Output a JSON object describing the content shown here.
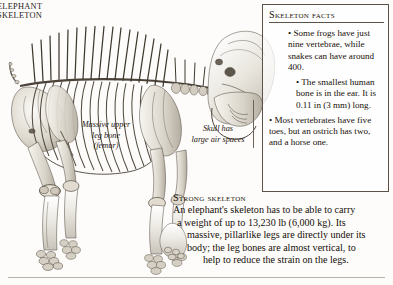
{
  "running_head": {
    "line1": "ELEPHANT",
    "line2": "SKELETON"
  },
  "captions": {
    "femur": "Massive upper leg bone (femur)",
    "femur_lines": [
      "Massive upper",
      "leg bone",
      "(femur)"
    ],
    "skull": "Skull has large air spaces",
    "skull_lines": [
      "Skull has",
      "large air spaces"
    ]
  },
  "facts_box": {
    "title": "Skeleton facts",
    "bullets": [
      "• Some frogs have just nine vertebrae, while snakes can have around 400.",
      "• The smallest human bone is in the ear. It is 0.11 in (3 mm) long.",
      "• Most vertebrates have five toes, but an ostrich has two, and a horse one."
    ]
  },
  "strong_skeleton": {
    "title": "Strong skeleton",
    "body": "An elephant's skeleton has to be able to carry a weight of up to 13,230 lb (6,000 kg). Its massive, pillarlike legs are directly under its body; the leg bones are almost vertical, to help to reduce the strain on the legs.",
    "lines": [
      "An elephant's skeleton has to be able to carry",
      "a weight of up to 13,230 lb (6,000 kg). Its",
      "massive, pillarlike legs are directly under its",
      "body; the leg bones are almost vertical, to",
      "help to reduce the strain on the legs."
    ],
    "weight_lb": "13,230 lb",
    "weight_kg": "6,000 kg"
  },
  "artwork": {
    "subject": "elephant-skeleton",
    "description": "Side view of a mounted elephant skeleton facing right, showing skull with tusk sockets, vertebral column, ribcage, pelvis, and four pillarlike legs with foot bones.",
    "ink": "#3a332c"
  },
  "colors": {
    "page_background": "#fdfcfa",
    "text": "#150f08",
    "rule": "#5d5248",
    "bottom_rule": "#b9b2a8",
    "leader_line": "#6d6257"
  }
}
